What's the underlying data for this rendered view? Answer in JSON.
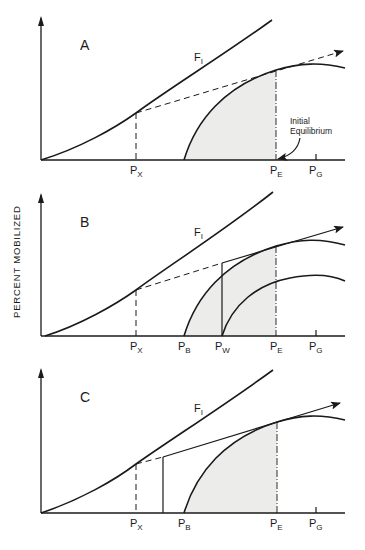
{
  "figure": {
    "y_axis_label": "PERCENT MOBILIZED",
    "panels": [
      {
        "id": "A",
        "label": "A",
        "curve_label": "F",
        "curve_label_sub": "I",
        "ticks": [
          {
            "main": "P",
            "sub": "X"
          },
          {
            "main": "P",
            "sub": "E"
          },
          {
            "main": "P",
            "sub": "G"
          }
        ],
        "annotation_line1": "Initial",
        "annotation_line2": "Equilibrium"
      },
      {
        "id": "B",
        "label": "B",
        "curve_label": "F",
        "curve_label_sub": "I",
        "ticks": [
          {
            "main": "P",
            "sub": "X"
          },
          {
            "main": "P",
            "sub": "B"
          },
          {
            "main": "P",
            "sub": "W"
          },
          {
            "main": "P",
            "sub": "E"
          },
          {
            "main": "P",
            "sub": "G"
          }
        ]
      },
      {
        "id": "C",
        "label": "C",
        "curve_label": "F",
        "curve_label_sub": "I",
        "ticks": [
          {
            "main": "P",
            "sub": "X"
          },
          {
            "main": "P",
            "sub": "B"
          },
          {
            "main": "P",
            "sub": "E"
          },
          {
            "main": "P",
            "sub": "G"
          }
        ]
      }
    ]
  }
}
